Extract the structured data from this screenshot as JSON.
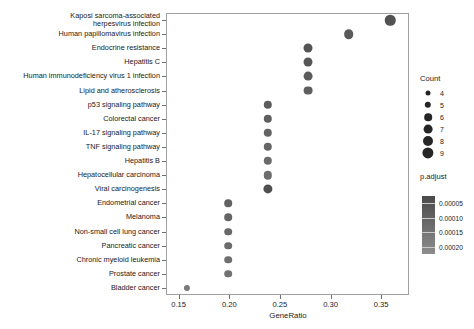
{
  "chart_data": {
    "type": "scatter",
    "title": "",
    "xlabel": "GeneRatio",
    "ylabel": "",
    "xlim": [
      0.1375,
      0.3775
    ],
    "xticks": [
      0.15,
      0.2,
      0.25,
      0.3,
      0.35
    ],
    "xticklabels": [
      "0.15",
      "0.20",
      "0.25",
      "0.30",
      "0.35"
    ],
    "grid": false,
    "categories": [
      "Kaposi sarcoma-associated\nherpesvirus infection",
      "Human papillomavirus infection",
      "Endocrine resistance",
      "Hepatitis C",
      "Human immunodeficiency virus 1 infection",
      "Lipid and atherosclerosis",
      "p53 signaling pathway",
      "Colorectal cancer",
      "IL-17 signaling pathway",
      "TNF signaling pathway",
      "Hepatitis B",
      "Hepatocellular carcinoma",
      "Viral carcinogenesis",
      "Endometrial cancer",
      "Melanoma",
      "Non-small cell lung cancer",
      "Pancreatic cancer",
      "Chronic myeloid leukemia",
      "Prostate cancer",
      "Bladder cancer"
    ],
    "points": [
      {
        "label": "Kaposi sarcoma-associated\nherpesvirus infection",
        "gene_ratio": 0.359,
        "count": 9,
        "p_adjust": 5e-05,
        "size": 10.5,
        "color": "#525252"
      },
      {
        "label": "Human papillomavirus infection",
        "gene_ratio": 0.318,
        "count": 8,
        "p_adjust": 9e-05,
        "size": 9.6,
        "color": "#5a5a5a"
      },
      {
        "label": "Endocrine resistance",
        "gene_ratio": 0.278,
        "count": 7,
        "p_adjust": 6e-05,
        "size": 9.0,
        "color": "#545454"
      },
      {
        "label": "Hepatitis C",
        "gene_ratio": 0.278,
        "count": 7,
        "p_adjust": 7e-05,
        "size": 9.0,
        "color": "#565656"
      },
      {
        "label": "Human immunodeficiency virus 1 infection",
        "gene_ratio": 0.278,
        "count": 7,
        "p_adjust": 9e-05,
        "size": 8.8,
        "color": "#5c5c5c"
      },
      {
        "label": "Lipid and atherosclerosis",
        "gene_ratio": 0.278,
        "count": 7,
        "p_adjust": 0.0001,
        "size": 8.8,
        "color": "#5f5f5f"
      },
      {
        "label": "p53 signaling pathway",
        "gene_ratio": 0.238,
        "count": 6,
        "p_adjust": 9e-05,
        "size": 8.4,
        "color": "#5c5c5c"
      },
      {
        "label": "Colorectal cancer",
        "gene_ratio": 0.238,
        "count": 6,
        "p_adjust": 0.0001,
        "size": 8.4,
        "color": "#5f5f5f"
      },
      {
        "label": "IL-17 signaling pathway",
        "gene_ratio": 0.238,
        "count": 6,
        "p_adjust": 0.00011,
        "size": 8.4,
        "color": "#636363"
      },
      {
        "label": "TNF signaling pathway",
        "gene_ratio": 0.238,
        "count": 6,
        "p_adjust": 0.00012,
        "size": 8.4,
        "color": "#666666"
      },
      {
        "label": "Hepatitis B",
        "gene_ratio": 0.238,
        "count": 6,
        "p_adjust": 0.00013,
        "size": 8.4,
        "color": "#6a6a6a"
      },
      {
        "label": "Hepatocellular carcinoma",
        "gene_ratio": 0.238,
        "count": 6,
        "p_adjust": 0.00014,
        "size": 8.4,
        "color": "#6d6d6d"
      },
      {
        "label": "Viral carcinogenesis",
        "gene_ratio": 0.238,
        "count": 6,
        "p_adjust": 6e-05,
        "size": 9.2,
        "color": "#4f4f4f"
      },
      {
        "label": "Endometrial cancer",
        "gene_ratio": 0.199,
        "count": 5,
        "p_adjust": 0.00011,
        "size": 7.6,
        "color": "#626262"
      },
      {
        "label": "Melanoma",
        "gene_ratio": 0.199,
        "count": 5,
        "p_adjust": 0.00012,
        "size": 7.6,
        "color": "#656565"
      },
      {
        "label": "Non-small cell lung cancer",
        "gene_ratio": 0.199,
        "count": 5,
        "p_adjust": 0.00013,
        "size": 7.6,
        "color": "#696969"
      },
      {
        "label": "Pancreatic cancer",
        "gene_ratio": 0.199,
        "count": 5,
        "p_adjust": 0.00014,
        "size": 7.6,
        "color": "#6c6c6c"
      },
      {
        "label": "Chronic myeloid leukemia",
        "gene_ratio": 0.199,
        "count": 5,
        "p_adjust": 0.00015,
        "size": 7.6,
        "color": "#6f6f6f"
      },
      {
        "label": "Prostate cancer",
        "gene_ratio": 0.199,
        "count": 5,
        "p_adjust": 0.00016,
        "size": 7.6,
        "color": "#727272"
      },
      {
        "label": "Bladder cancer",
        "gene_ratio": 0.158,
        "count": 4,
        "p_adjust": 0.00019,
        "size": 6.2,
        "color": "#7a7a7a"
      }
    ],
    "legends": [
      {
        "name": "count-legend",
        "title": "Count",
        "type": "size",
        "entries": [
          {
            "label": "4",
            "size": 5.0
          },
          {
            "label": "5",
            "size": 6.4
          },
          {
            "label": "6",
            "size": 7.6
          },
          {
            "label": "7",
            "size": 8.8
          },
          {
            "label": "8",
            "size": 10.0
          },
          {
            "label": "9",
            "size": 11.2
          }
        ]
      },
      {
        "name": "padjust-legend",
        "title": "p.adjust",
        "type": "colorbar",
        "ticks": [
          "0.00005",
          "0.00010",
          "0.00015",
          "0.00020"
        ],
        "gradient_top": "#4a4a4a",
        "gradient_bottom": "#8d8d8d"
      }
    ]
  }
}
